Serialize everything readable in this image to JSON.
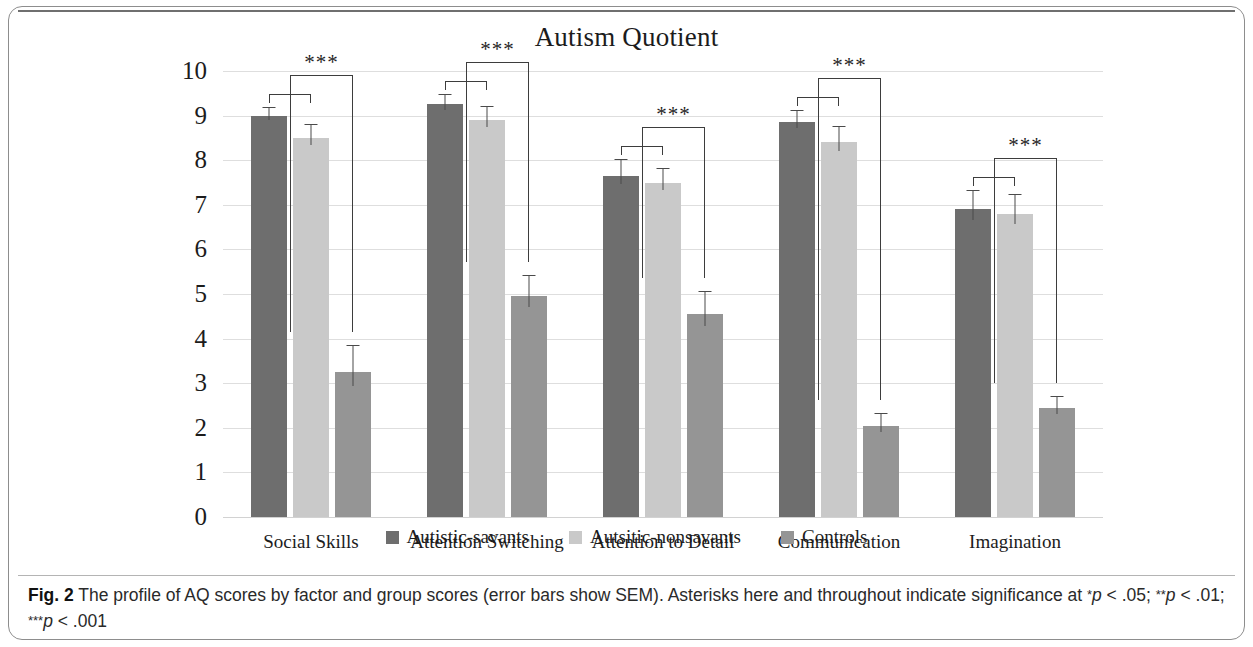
{
  "figure": {
    "label": "Fig. 2",
    "caption_text": " The profile of AQ scores by factor and group scores (error bars show SEM). Asterisks here and throughout indicate significance at ",
    "caption_p1": "p",
    "caption_p1_val": " < .05; ",
    "caption_p2": "p",
    "caption_p2_val": " < .01; ",
    "caption_p3": "p",
    "caption_p3_val": " < .001",
    "star1": "*",
    "star2": "**",
    "star3": "***"
  },
  "chart_data": {
    "type": "bar",
    "title": "Autism Quotient",
    "xlabel": "",
    "ylabel": "",
    "ylim": [
      0,
      10
    ],
    "yticks": [
      10,
      9,
      8,
      7,
      6,
      5,
      4,
      3,
      2,
      1,
      0
    ],
    "grid": true,
    "legend_position": "bottom",
    "categories": [
      "Social Skills",
      "Attention Switching",
      "Attention to Detail",
      "Communication",
      "Imagination"
    ],
    "series": [
      {
        "name": "Autistic-savants",
        "color": "#6e6e6e",
        "values": [
          9.0,
          9.25,
          7.65,
          8.85,
          6.9
        ],
        "errors": [
          0.18,
          0.22,
          0.35,
          0.25,
          0.42
        ]
      },
      {
        "name": "Autsitic-nonsavants",
        "color": "#c9c9c9",
        "values": [
          8.5,
          8.9,
          7.5,
          8.4,
          6.8
        ],
        "errors": [
          0.3,
          0.3,
          0.3,
          0.35,
          0.42
        ]
      },
      {
        "name": "Controls",
        "color": "#959595",
        "values": [
          3.25,
          4.95,
          4.55,
          2.05,
          2.45
        ],
        "errors": [
          0.58,
          0.45,
          0.5,
          0.25,
          0.25
        ]
      }
    ],
    "annotations": [
      {
        "category": "Social Skills",
        "stars": "***"
      },
      {
        "category": "Attention Switching",
        "stars": "***"
      },
      {
        "category": "Attention to Detail",
        "stars": "***"
      },
      {
        "category": "Communication",
        "stars": "***"
      },
      {
        "category": "Imagination",
        "stars": "***"
      }
    ]
  }
}
